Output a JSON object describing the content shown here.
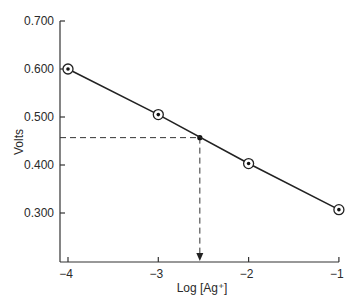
{
  "chart_data": {
    "type": "line",
    "title": "",
    "xlabel": "Log [Ag⁺]",
    "ylabel": "Volts",
    "xlim": [
      -4.1,
      -1
    ],
    "ylim": [
      0.21,
      0.7
    ],
    "grid": false,
    "legend": null,
    "x_ticks": [
      -4,
      -3,
      -2,
      -1
    ],
    "x_tick_labels": [
      "−4",
      "−3",
      "−2",
      "−1"
    ],
    "y_ticks": [
      0.7,
      0.6,
      0.5,
      0.4,
      0.3
    ],
    "y_tick_labels": [
      "0.700",
      "0.600",
      "0.500",
      "0.400",
      "0.300"
    ],
    "series": [
      {
        "name": "Calibration",
        "x": [
          -4,
          -3,
          -2,
          -1
        ],
        "y": [
          0.6,
          0.505,
          0.403,
          0.307
        ],
        "marker": "circled-dot"
      }
    ],
    "annotations": [
      {
        "type": "interpolation",
        "description": "Dashed lines from measured voltage to the calibration line and down to the x-axis",
        "x": -2.54,
        "y": 0.457
      }
    ]
  }
}
